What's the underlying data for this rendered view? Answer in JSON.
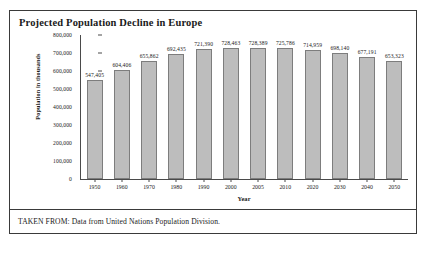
{
  "figure": {
    "title": "Projected Population Decline in Europe",
    "source_note": "TAKEN FROM: Data from United Nations Population Division."
  },
  "chart_data": {
    "type": "bar",
    "title": "Projected Population Decline in Europe",
    "xlabel": "Year",
    "ylabel": "Population in thousands",
    "categories": [
      "1950",
      "1960",
      "1970",
      "1980",
      "1990",
      "2000",
      "2005",
      "2010",
      "2020",
      "2030",
      "2040",
      "2050"
    ],
    "values": [
      547405,
      604406,
      655862,
      692435,
      721390,
      728463,
      728389,
      725786,
      714959,
      698140,
      677191,
      653323
    ],
    "value_labels": [
      "547,405",
      "604,406",
      "655,862",
      "692,435",
      "721,390",
      "728,463",
      "728,389",
      "725,786",
      "714,959",
      "698,140",
      "677,191",
      "653,323"
    ],
    "ylim": [
      0,
      800000
    ],
    "ytick_labels": [
      "800,000",
      "700,000",
      "600,000",
      "500,000",
      "400,000",
      "300,000",
      "200,000",
      "100,000",
      "0"
    ],
    "ytick_values": [
      800000,
      700000,
      600000,
      500000,
      400000,
      300000,
      200000,
      100000,
      0
    ],
    "grid": false,
    "legend": false,
    "bar_color": "#bdbdbd",
    "bar_border_color": "#7d7d7d",
    "axis_color": "#4a4a4a"
  }
}
